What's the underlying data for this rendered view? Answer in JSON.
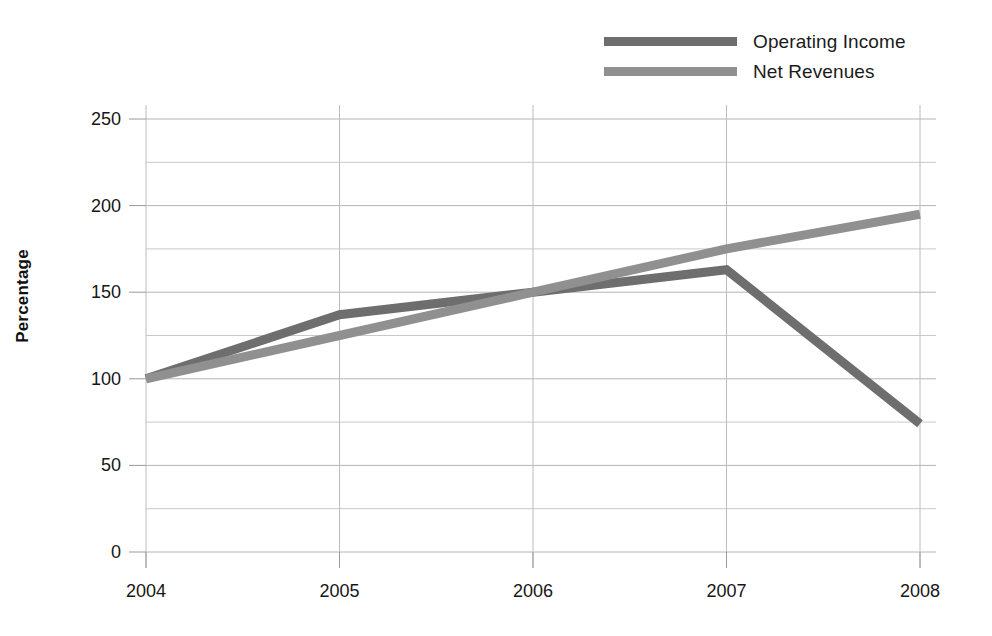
{
  "legend": {
    "position": "top-right",
    "entries": [
      {
        "label": "Operating Income",
        "color": "#6e6e6e",
        "swatch_name": "legend-swatch-operating-income"
      },
      {
        "label": "Net Revenues",
        "color": "#909090",
        "swatch_name": "legend-swatch-net-revenues"
      }
    ]
  },
  "axes": {
    "ylabel": "Percentage",
    "xlabel": "",
    "yticks": [
      "250",
      "200",
      "150",
      "100",
      "50",
      "0"
    ],
    "xticks": [
      "2004",
      "2005",
      "2006",
      "2007",
      "2008"
    ]
  },
  "chart_data": {
    "type": "line",
    "title": "",
    "xlabel": "",
    "ylabel": "Percentage",
    "categories": [
      "2004",
      "2005",
      "2006",
      "2007",
      "2008"
    ],
    "x": [
      2004,
      2005,
      2006,
      2007,
      2008
    ],
    "series": [
      {
        "name": "Operating Income",
        "color": "#6e6e6e",
        "values": [
          100,
          137,
          150,
          163,
          74
        ]
      },
      {
        "name": "Net Revenues",
        "color": "#909090",
        "values": [
          100,
          125,
          150,
          175,
          195
        ]
      }
    ],
    "ylim": [
      0,
      250
    ],
    "yticks": [
      0,
      50,
      100,
      150,
      200,
      250
    ],
    "yminor_step": 25,
    "grid": "horizontal-major-and-minor",
    "legend_position": "top-right",
    "markers": false,
    "linewidth": 9
  }
}
